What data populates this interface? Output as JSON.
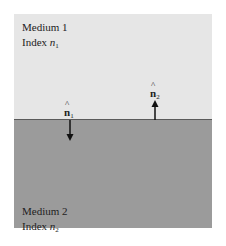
{
  "diagram": {
    "type": "interface-normals",
    "medium1": {
      "name": "Medium 1",
      "index_label": "Index",
      "index_symbol": "n",
      "index_sub": "1",
      "color": "#e6e6e6"
    },
    "medium2": {
      "name": "Medium 2",
      "index_label": "Index",
      "index_symbol": "n",
      "index_sub": "2",
      "color": "#9b9b9b"
    },
    "normals": [
      {
        "symbol": "n",
        "hat": "^",
        "sub": "1",
        "direction": "down",
        "into": "Medium 2"
      },
      {
        "symbol": "n",
        "hat": "^",
        "sub": "2",
        "direction": "up",
        "into": "Medium 1"
      }
    ]
  }
}
